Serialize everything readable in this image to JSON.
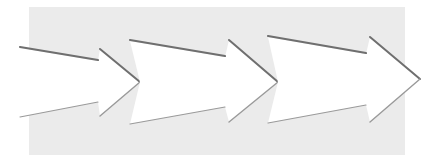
{
  "diagram": {
    "type": "process-flow-arrows",
    "canvas": {
      "width": 439,
      "height": 162,
      "color": "#ffffff"
    },
    "panel": {
      "x": 29,
      "y": 7,
      "width": 376,
      "height": 148,
      "color": "#ebebeb"
    },
    "arrow_fill": "#ffffff",
    "edge_shadow_dark": "#6f6f6f",
    "edge_shadow_light": "#9a9a9a",
    "arrows": [
      {
        "id": "arrow-1",
        "points": [
          [
            20,
            48
          ],
          [
            98,
            61
          ],
          [
            100,
            49
          ],
          [
            140,
            82
          ],
          [
            100,
            116
          ],
          [
            98,
            102
          ],
          [
            20,
            117
          ]
        ],
        "top_edge": [
          [
            20,
            48
          ],
          [
            98,
            61
          ]
        ],
        "head_top_edge": [
          [
            100,
            49
          ],
          [
            140,
            82
          ]
        ],
        "head_bottom_edge": [
          [
            140,
            82
          ],
          [
            100,
            116
          ]
        ],
        "bottom_edge": [
          [
            98,
            102
          ],
          [
            20,
            117
          ]
        ]
      },
      {
        "id": "arrow-2",
        "points": [
          [
            130,
            41
          ],
          [
            140,
            82
          ],
          [
            130,
            124
          ],
          [
            225,
            107
          ],
          [
            229,
            122
          ],
          [
            278,
            82
          ],
          [
            229,
            40
          ],
          [
            225,
            57
          ]
        ],
        "top_edge": [
          [
            130,
            41
          ],
          [
            225,
            57
          ]
        ],
        "head_top_edge": [
          [
            229,
            40
          ],
          [
            278,
            82
          ]
        ],
        "head_bottom_edge": [
          [
            278,
            82
          ],
          [
            229,
            122
          ]
        ],
        "bottom_edge": [
          [
            225,
            107
          ],
          [
            130,
            124
          ]
        ]
      },
      {
        "id": "arrow-3",
        "points": [
          [
            268,
            37
          ],
          [
            278,
            82
          ],
          [
            268,
            123
          ],
          [
            366,
            105
          ],
          [
            370,
            122
          ],
          [
            420,
            79
          ],
          [
            370,
            37
          ],
          [
            366,
            54
          ]
        ],
        "top_edge": [
          [
            268,
            37
          ],
          [
            366,
            54
          ]
        ],
        "head_top_edge": [
          [
            370,
            37
          ],
          [
            420,
            79
          ]
        ],
        "head_bottom_edge": [
          [
            420,
            79
          ],
          [
            370,
            122
          ]
        ],
        "bottom_edge": [
          [
            366,
            105
          ],
          [
            268,
            123
          ]
        ]
      }
    ]
  }
}
